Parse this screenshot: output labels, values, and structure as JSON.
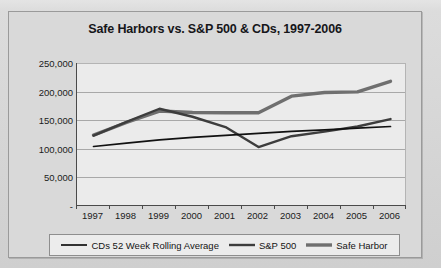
{
  "chart_data": {
    "type": "line",
    "title": "Safe Harbors vs. S&P 500 & CDs, 1997-2006",
    "xlabel": "",
    "ylabel": "",
    "x": [
      1997,
      1998,
      1999,
      2000,
      2001,
      2002,
      2003,
      2004,
      2005,
      2006
    ],
    "categories": [
      "1997",
      "1998",
      "1999",
      "2000",
      "2001",
      "2002",
      "2003",
      "2004",
      "2005",
      "2006"
    ],
    "ylim": [
      0,
      250000
    ],
    "ytick_values": [
      250000,
      200000,
      150000,
      100000,
      50000,
      0
    ],
    "ytick_labels": [
      "250,000",
      "200,000",
      "150,000",
      "100,000",
      "50,000",
      "-"
    ],
    "grid": true,
    "legend_position": "bottom",
    "series": [
      {
        "name": "CDs 52 Week Rolling Average",
        "color": "#111111",
        "width": 1.7,
        "values": [
          104000,
          110000,
          115500,
          120000,
          123500,
          127000,
          130500,
          133000,
          136000,
          139000
        ]
      },
      {
        "name": "S&P 500",
        "color": "#3d3d3d",
        "width": 2.4,
        "values": [
          123000,
          147000,
          170000,
          156000,
          138000,
          103000,
          122000,
          130000,
          139000,
          152000
        ]
      },
      {
        "name": "Safe Harbor",
        "color": "#6f6f6f",
        "width": 3.4,
        "values": [
          124000,
          146000,
          166000,
          163500,
          163000,
          163000,
          192000,
          198500,
          199500,
          218000
        ]
      }
    ]
  },
  "legend": {
    "items": [
      {
        "label": "CDs 52 Week Rolling Average"
      },
      {
        "label": "S&P 500"
      },
      {
        "label": "Safe Harbor"
      }
    ]
  }
}
